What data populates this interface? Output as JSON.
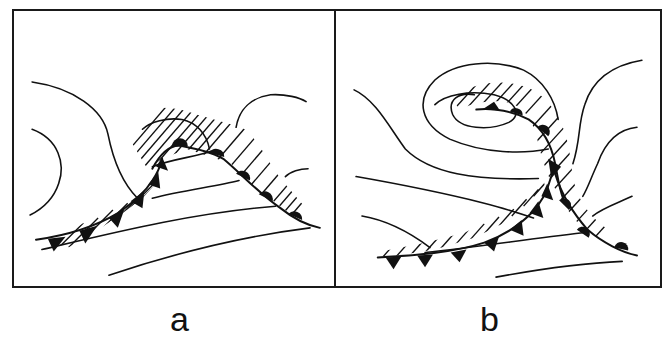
{
  "figure": {
    "panels": [
      {
        "id": "a",
        "label": "a",
        "description": "Frontal wave with cold front (triangles) and warm front (semicircles) forming a warm sector; hatched precipitation area ahead of warm front and along cold front"
      },
      {
        "id": "b",
        "label": "b",
        "description": "Occluded cyclone with spiral isobars around low center; occluded front curling into the low, cold front trailing southwest; hatched precipitation band along occlusion and warm front"
      }
    ],
    "legend_elements": {
      "cold_front_symbol": "triangles",
      "warm_front_symbol": "semicircles",
      "precipitation": "diagonal hatching",
      "isobars": "thin solid lines"
    },
    "colors": {
      "ink": "#111111",
      "background": "#ffffff"
    }
  }
}
